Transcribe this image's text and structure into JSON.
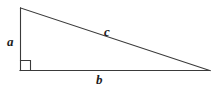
{
  "figure": {
    "name": "right-triangle",
    "background_color": "#ffffff",
    "stroke_color": "#3a3a3a",
    "label_color": "#1c1c1c",
    "width": 216,
    "height": 89,
    "vertices": {
      "top": [
        20,
        8
      ],
      "bottom_left": [
        20,
        70
      ],
      "bottom_right": [
        210,
        70
      ]
    },
    "right_angle_marker": {
      "name": "right-angle-square",
      "at_vertex": "bottom_left",
      "size": 10,
      "x": 20,
      "y": 60
    },
    "sides": [
      {
        "name": "vertical-leg",
        "label": "a",
        "from": "top",
        "to": "bottom_left"
      },
      {
        "name": "base-leg",
        "label": "b",
        "from": "bottom_left",
        "to": "bottom_right"
      },
      {
        "name": "hypotenuse",
        "label": "c",
        "from": "top",
        "to": "bottom_right"
      }
    ],
    "labels": {
      "a": "a",
      "b": "b",
      "c": "c"
    }
  }
}
